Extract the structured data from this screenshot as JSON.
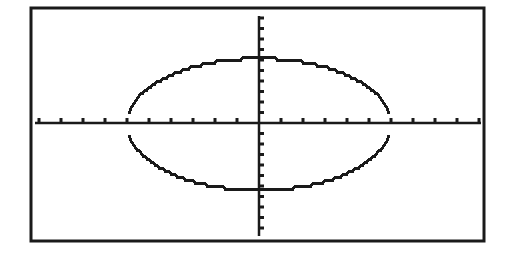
{
  "chart_data": {
    "type": "line",
    "title": "",
    "xlabel": "",
    "ylabel": "",
    "grid": false,
    "legend": null,
    "tick_labels": false,
    "x_ticks_each_side": 10,
    "y_ticks_each_side": 11,
    "pixel_geometry": {
      "frame": {
        "left": 31,
        "top": 8,
        "right": 484,
        "bottom": 241
      },
      "origin": {
        "x": 259,
        "y": 123
      },
      "x_tick_spacing_px": 22,
      "y_tick_spacing_px": 10.5,
      "ellipse": {
        "cx": 259,
        "cy": 124,
        "rx": 132,
        "ry": 66,
        "end_gap_px": 8
      }
    },
    "series": [
      {
        "name": "upper half",
        "color": "#1a1a1a"
      },
      {
        "name": "lower half",
        "color": "#1a1a1a"
      }
    ]
  },
  "colors": {
    "background": "#ffffff",
    "ink": "#1a1a1a"
  }
}
